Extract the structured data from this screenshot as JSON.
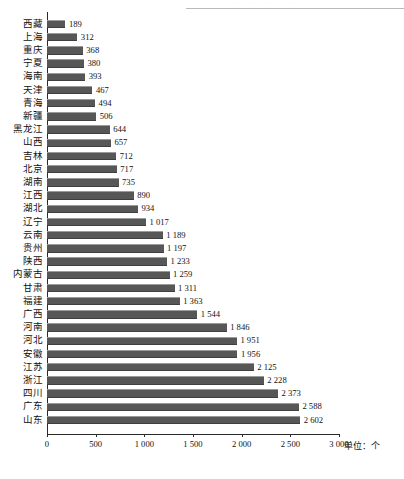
{
  "page_header": {
    "ghost_text": "·· ·· ··· · ·· ·",
    "rule_color": "#b9b9b9"
  },
  "chart_data": {
    "type": "bar",
    "orientation": "horizontal",
    "title": "",
    "subtitle": "",
    "xlabel": "",
    "ylabel": "",
    "unit_label": "单位：个",
    "categories": [
      "西藏",
      "上海",
      "重庆",
      "宁夏",
      "海南",
      "天津",
      "青海",
      "新疆",
      "黑龙江",
      "山西",
      "吉林",
      "北京",
      "湖南",
      "江西",
      "湖北",
      "辽宁",
      "云南",
      "贵州",
      "陕西",
      "内蒙古",
      "甘肃",
      "福建",
      "广西",
      "河南",
      "河北",
      "安徽",
      "江苏",
      "浙江",
      "四川",
      "广东",
      "山东"
    ],
    "values": [
      189,
      312,
      368,
      380,
      393,
      467,
      494,
      506,
      644,
      657,
      712,
      717,
      735,
      890,
      934,
      1017,
      1189,
      1197,
      1233,
      1259,
      1311,
      1363,
      1544,
      1846,
      1951,
      1956,
      2125,
      2228,
      2373,
      2588,
      2602
    ],
    "value_labels": [
      "189",
      "312",
      "368",
      "380",
      "393",
      "467",
      "494",
      "506",
      "644",
      "657",
      "712",
      "717",
      "735",
      "890",
      "934",
      "1 017",
      "1 189",
      "1 197",
      "1 233",
      "1 259",
      "1 311",
      "1 363",
      "1 544",
      "1 846",
      "1 951",
      "1 956",
      "2 125",
      "2 228",
      "2 373",
      "2 588",
      "2 602"
    ],
    "xlim": [
      0,
      3000
    ],
    "xticks": [
      0,
      500,
      1000,
      1500,
      2000,
      2500,
      3000
    ],
    "xtick_labels": [
      "0",
      "500",
      "1 000",
      "1 500",
      "2 000",
      "2 500",
      "3 000"
    ],
    "grid": false,
    "legend": null,
    "bar_color": "#575757",
    "axis_color": "#2a2a2a"
  }
}
